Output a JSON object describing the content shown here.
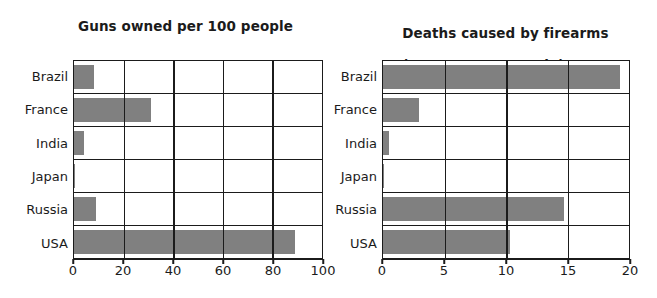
{
  "chart_data": [
    {
      "id": "guns-owned",
      "type": "bar",
      "orientation": "horizontal",
      "title": "Guns owned per 100 people",
      "xlabel": "",
      "ylabel": "",
      "categories": [
        "Brazil",
        "France",
        "India",
        "Japan",
        "Russia",
        "USA"
      ],
      "values": [
        8,
        31,
        4,
        0.6,
        9,
        89
      ],
      "xlim": [
        0,
        100
      ],
      "xticks": [
        0,
        20,
        40,
        60,
        80,
        100
      ],
      "grid": "vertical-and-horizontal",
      "legend": "none",
      "bar_color": "#808080",
      "frame_color": "#1b1b1b"
    },
    {
      "id": "firearm-deaths",
      "type": "bar",
      "orientation": "horizontal",
      "title": "Deaths caused by firearms\n(per 100,000 people)",
      "title_line1": "Deaths caused by firearms",
      "title_line2": "(per 100,000 people)",
      "xlabel": "",
      "ylabel": "",
      "categories": [
        "Brazil",
        "France",
        "India",
        "Japan",
        "Russia",
        "USA"
      ],
      "values": [
        19.3,
        2.9,
        0.5,
        0.1,
        14.7,
        10.3
      ],
      "xlim": [
        0,
        20
      ],
      "xticks": [
        0,
        5,
        10,
        15,
        20
      ],
      "grid": "vertical-and-horizontal",
      "legend": "none",
      "bar_color": "#808080",
      "frame_color": "#1b1b1b"
    }
  ]
}
